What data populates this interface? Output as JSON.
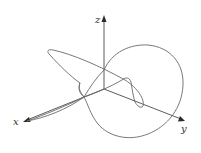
{
  "diagram": {
    "type": "3d-parametric-space-curve",
    "axes": {
      "x": {
        "label": "x"
      },
      "y": {
        "label": "y"
      },
      "z": {
        "label": "z"
      }
    },
    "colors": {
      "axis": "#4a4a4a",
      "curve": "#6a6a6a",
      "background": "#ffffff"
    }
  }
}
